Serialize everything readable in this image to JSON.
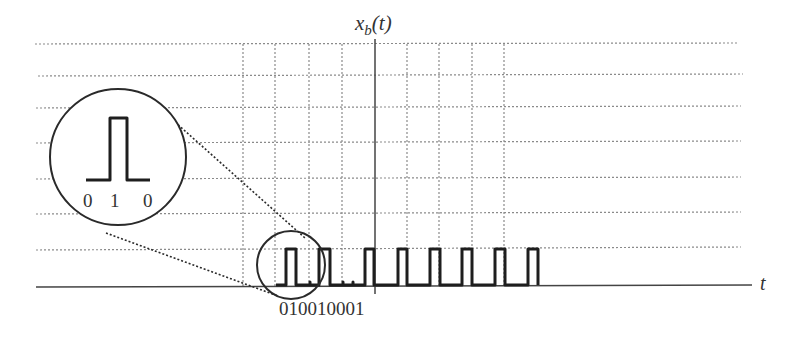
{
  "diagram": {
    "y_axis_label": "x",
    "y_axis_label_sub": "b",
    "y_axis_label_arg": "(t)",
    "x_axis_label": "t",
    "bit_sequence_label": "010010001",
    "magnified_bits": [
      "0",
      "1",
      "0"
    ],
    "colors": {
      "signal": "#1e1e1e",
      "grid": "#8a8a8a",
      "axis": "#444444",
      "background": "#ffffff"
    },
    "grid": {
      "horizontal_y": [
        44,
        74,
        107,
        143,
        179,
        214,
        249
      ],
      "vertical_x": [
        243,
        275,
        309,
        342,
        407,
        439,
        472,
        504
      ]
    },
    "pulses": [
      {
        "start_x": 286,
        "end_x": 296
      },
      {
        "start_x": 319,
        "end_x": 330
      },
      {
        "start_x": 365,
        "end_x": 374
      },
      {
        "start_x": 398,
        "end_x": 407
      },
      {
        "start_x": 430,
        "end_x": 440
      },
      {
        "start_x": 462,
        "end_x": 472
      },
      {
        "start_x": 495,
        "end_x": 505
      },
      {
        "start_x": 528,
        "end_x": 538
      }
    ]
  }
}
